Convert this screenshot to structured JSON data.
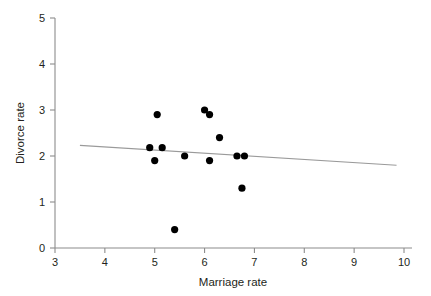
{
  "chart_data": {
    "type": "scatter",
    "title": "",
    "xlabel": "Marriage rate",
    "ylabel": "Divorce rate",
    "xlim": [
      3,
      10
    ],
    "ylim": [
      0,
      5
    ],
    "xticks": [
      3,
      4,
      5,
      6,
      7,
      8,
      9,
      10
    ],
    "xtick_labels": [
      "3",
      "4",
      "5",
      "6",
      "7",
      "8",
      "9",
      "10"
    ],
    "yticks": [
      0,
      1,
      2,
      3,
      4,
      5
    ],
    "ytick_labels": [
      "0",
      "1",
      "2",
      "3",
      "4",
      "5"
    ],
    "grid": false,
    "legend": false,
    "marker_color": "#000000",
    "trendline_color": "#9a9a9a",
    "axis_color": "#8c8c8c",
    "points": [
      {
        "x": 4.9,
        "y": 2.18
      },
      {
        "x": 5.05,
        "y": 2.9
      },
      {
        "x": 5.0,
        "y": 1.9
      },
      {
        "x": 5.15,
        "y": 2.18
      },
      {
        "x": 5.4,
        "y": 0.4
      },
      {
        "x": 5.6,
        "y": 2.0
      },
      {
        "x": 6.0,
        "y": 3.0
      },
      {
        "x": 6.1,
        "y": 2.9
      },
      {
        "x": 6.1,
        "y": 1.9
      },
      {
        "x": 6.3,
        "y": 2.4
      },
      {
        "x": 6.65,
        "y": 2.0
      },
      {
        "x": 6.8,
        "y": 2.0
      },
      {
        "x": 6.75,
        "y": 1.3
      }
    ],
    "trendline": {
      "x_start": 3.5,
      "y_start": 2.23,
      "x_end": 9.85,
      "y_end": 1.8
    }
  }
}
